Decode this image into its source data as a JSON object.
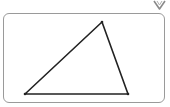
{
  "diagram": {
    "type": "triangle",
    "vertices": [
      {
        "label": "",
        "x": 25,
        "y": 94
      },
      {
        "label": "",
        "x": 102,
        "y": 22
      },
      {
        "label": "",
        "x": 128,
        "y": 94
      }
    ],
    "stroke_color": "#222222",
    "frame_color": "#9a9a9a"
  },
  "icons": {
    "corner": "chevron-down-icon"
  }
}
